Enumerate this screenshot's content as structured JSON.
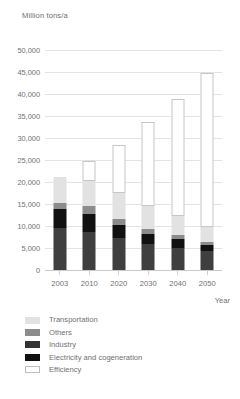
{
  "chart_data": {
    "type": "bar",
    "stacked": true,
    "title": "",
    "ylabel": "Million tons/a",
    "xlabel": "Year",
    "categories": [
      "2003",
      "2010",
      "2020",
      "2030",
      "2040",
      "2050"
    ],
    "ylim": [
      0,
      50000
    ],
    "ytick_labels": [
      "0",
      "5,000",
      "10,000",
      "15,000",
      "20,000",
      "25,000",
      "30,000",
      "35,000",
      "40,000",
      "45,000",
      "50,000"
    ],
    "ytick_values": [
      0,
      5000,
      10000,
      15000,
      20000,
      25000,
      30000,
      35000,
      40000,
      45000,
      50000
    ],
    "grid": true,
    "legend_position": "bottom-left",
    "series": [
      {
        "name": "Electricity and cogeneration",
        "color": "#3f3f3f",
        "values": [
          9600,
          8600,
          7300,
          5900,
          5100,
          4300
        ]
      },
      {
        "name": "Industry",
        "color": "#111111",
        "values": [
          4200,
          4100,
          2900,
          2200,
          1900,
          1400
        ]
      },
      {
        "name": "Others",
        "color": "#8c8c8c",
        "values": [
          1500,
          1800,
          1500,
          1200,
          900,
          600
        ]
      },
      {
        "name": "Transportation",
        "color": "#e2e2e2",
        "values": [
          5900,
          5800,
          5800,
          5200,
          4300,
          3400
        ]
      },
      {
        "name": "Efficiency",
        "color": "#ffffff",
        "values": [
          0,
          4400,
          10900,
          19200,
          26600,
          35000
        ]
      }
    ],
    "totals": [
      21200,
      24700,
      28400,
      33700,
      38800,
      44700
    ]
  },
  "legend": {
    "items": [
      {
        "label": "Transportation",
        "swatch": "#e2e2e2",
        "outlined": false
      },
      {
        "label": "Others",
        "swatch": "#8c8c8c",
        "outlined": false
      },
      {
        "label": "Industry",
        "swatch": "#333333",
        "outlined": false
      },
      {
        "label": "Electricity and cogeneration",
        "swatch": "#111111",
        "outlined": false
      },
      {
        "label": "Efficiency",
        "swatch": "#ffffff",
        "outlined": true
      }
    ]
  }
}
